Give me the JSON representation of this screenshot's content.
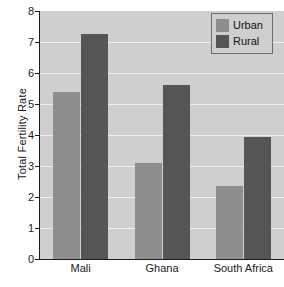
{
  "chart_data": {
    "type": "bar",
    "title": "",
    "xlabel": "",
    "ylabel": "Total Fertility Rate",
    "categories": [
      "Mali",
      "Ghana",
      "South Africa"
    ],
    "series": [
      {
        "name": "Urban",
        "color": "#8e8e8e",
        "values": [
          5.4,
          3.1,
          2.35
        ]
      },
      {
        "name": "Rural",
        "color": "#555555",
        "values": [
          7.25,
          5.6,
          3.95
        ]
      }
    ],
    "ylim": [
      0,
      8
    ],
    "y_ticks": [
      0,
      1,
      2,
      3,
      4,
      5,
      6,
      7,
      8
    ],
    "y_tick_labels": [
      "0",
      "1",
      "2",
      "3",
      "4",
      "5",
      "6",
      "7",
      "8"
    ],
    "grid": true,
    "grid_color": "#efefef",
    "plot_background": "#cfcfcf",
    "legend_position": "top-right",
    "legend_entries": [
      "Urban",
      "Rural"
    ]
  }
}
